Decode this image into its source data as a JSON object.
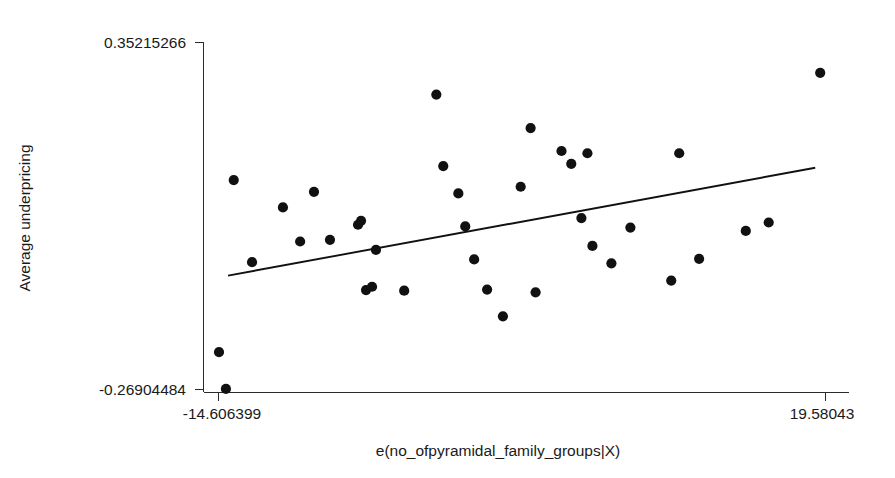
{
  "chart_data": {
    "type": "scatter",
    "title": "",
    "subtitle": "",
    "xlabel": "e(no_ofpyramidal_family_groups|X)",
    "ylabel": "Average underpricing",
    "grid": false,
    "legend": null,
    "x_tick_labels": [
      "-14.606399",
      "19.58043"
    ],
    "y_tick_labels": [
      "0.35215266",
      "-0.26904484"
    ],
    "xlim": [
      -14.606399,
      19.58043
    ],
    "ylim": [
      -0.26904484,
      0.35215266
    ],
    "x_ticks": [
      -14.606399,
      19.58043
    ],
    "y_ticks": [
      -0.26904484,
      0.35215266
    ],
    "series": [
      {
        "name": "observations",
        "marker": "filled-circle",
        "color": "#111111",
        "points": [
          {
            "x": -14.55,
            "y": -0.203
          },
          {
            "x": -14.16,
            "y": -0.269
          },
          {
            "x": -13.72,
            "y": 0.105
          },
          {
            "x": -12.69,
            "y": -0.042
          },
          {
            "x": -10.95,
            "y": 0.056
          },
          {
            "x": -9.98,
            "y": -0.005
          },
          {
            "x": -9.2,
            "y": 0.084
          },
          {
            "x": -8.3,
            "y": -0.002
          },
          {
            "x": -6.72,
            "y": 0.025
          },
          {
            "x": -6.55,
            "y": 0.032
          },
          {
            "x": -6.27,
            "y": -0.092
          },
          {
            "x": -5.93,
            "y": -0.086
          },
          {
            "x": -5.71,
            "y": -0.02
          },
          {
            "x": -4.12,
            "y": -0.093
          },
          {
            "x": -2.31,
            "y": 0.258
          },
          {
            "x": -1.92,
            "y": 0.13
          },
          {
            "x": -1.07,
            "y": 0.081
          },
          {
            "x": -0.68,
            "y": 0.022
          },
          {
            "x": -0.18,
            "y": -0.037
          },
          {
            "x": 0.55,
            "y": -0.091
          },
          {
            "x": 1.44,
            "y": -0.139
          },
          {
            "x": 2.44,
            "y": 0.093
          },
          {
            "x": 3.0,
            "y": 0.198
          },
          {
            "x": 3.28,
            "y": -0.096
          },
          {
            "x": 4.74,
            "y": 0.157
          },
          {
            "x": 5.29,
            "y": 0.134
          },
          {
            "x": 5.86,
            "y": 0.037
          },
          {
            "x": 6.2,
            "y": 0.153
          },
          {
            "x": 6.48,
            "y": -0.013
          },
          {
            "x": 7.55,
            "y": -0.044
          },
          {
            "x": 8.62,
            "y": 0.02
          },
          {
            "x": 10.92,
            "y": -0.075
          },
          {
            "x": 11.37,
            "y": 0.153
          },
          {
            "x": 12.49,
            "y": -0.036
          },
          {
            "x": 15.12,
            "y": 0.014
          },
          {
            "x": 16.41,
            "y": 0.029
          },
          {
            "x": 19.31,
            "y": 0.297
          }
        ]
      }
    ],
    "fit_line": {
      "name": "linear fit",
      "color": "#111111",
      "x_start": -14.04,
      "y_start": -0.066,
      "x_end": 19.03,
      "y_end": 0.127
    }
  },
  "axes": {
    "y_top_label": "0.35215266",
    "y_bottom_label": "-0.26904484",
    "x_left_label": "-14.606399",
    "x_right_label": "19.58043",
    "x_axis_title": "e(no_ofpyramidal_family_groups|X)",
    "y_axis_title": "Average underpricing"
  },
  "style": {
    "background": "#ffffff",
    "marker_color": "#111111",
    "line_color": "#111111",
    "axis_color": "#2b2b2b"
  }
}
